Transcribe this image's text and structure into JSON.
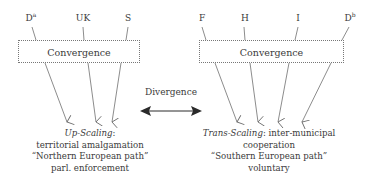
{
  "left": {
    "sources": [
      {
        "label": "D",
        "sup": "a"
      },
      {
        "label": "UK",
        "sup": ""
      },
      {
        "label": "S",
        "sup": ""
      }
    ],
    "box_label": "Convergence",
    "caption": {
      "title": "Up-Scaling",
      "title_suffix": ":",
      "lines": [
        "territorial amalgamation",
        "“Northern European path”",
        "parl. enforcement"
      ]
    }
  },
  "right": {
    "sources": [
      {
        "label": "F",
        "sup": ""
      },
      {
        "label": "H",
        "sup": ""
      },
      {
        "label": "I",
        "sup": ""
      },
      {
        "label": "D",
        "sup": "b"
      }
    ],
    "box_label": "Convergence",
    "caption": {
      "title": "Trans-Scaling",
      "title_suffix": ": inter-municipal",
      "lines": [
        "cooperation",
        "“Southern European path”",
        "voluntary"
      ]
    }
  },
  "center": {
    "label": "Divergence",
    "arrow": "double-headed"
  },
  "colors": {
    "line": "#6e6e6e",
    "text": "#3a3a3a",
    "arrow": "#2a2a2a"
  }
}
